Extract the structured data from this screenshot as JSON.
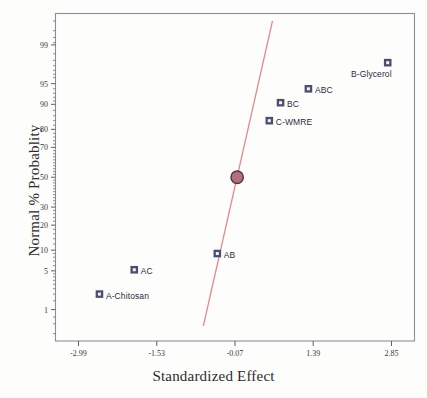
{
  "chart_data": {
    "type": "scatter",
    "title": "",
    "xlabel": "Standardized Effect",
    "ylabel": "Normal % Probablity",
    "xlim": [
      -3.42,
      3.28
    ],
    "ylim_percent": [
      0.2,
      99.8
    ],
    "grid": false,
    "legend": false,
    "xticks": [
      "-2.99",
      "-1.53",
      "-0.07",
      "1.39",
      "2.85"
    ],
    "xtick_values": [
      -2.99,
      -1.53,
      -0.07,
      1.39,
      2.85
    ],
    "yticks": [
      "99",
      "95",
      "90",
      "80",
      "70",
      "50",
      "30",
      "20",
      "10",
      "5",
      "1"
    ],
    "ytick_values": [
      99,
      95,
      90,
      80,
      70,
      50,
      30,
      20,
      10,
      5,
      1
    ],
    "series": [
      {
        "name": "effects",
        "marker": "square",
        "marker_color": "#4a4f6e",
        "points": [
          {
            "label": "A-Chitosan",
            "x": -2.6,
            "y_percent": 2.0,
            "label_side": "right"
          },
          {
            "label": "AC",
            "x": -1.95,
            "y_percent": 5.2,
            "label_side": "right"
          },
          {
            "label": "AB",
            "x": -0.4,
            "y_percent": 9.0,
            "label_side": "right"
          },
          {
            "label": "C-WMRE",
            "x": 0.57,
            "y_percent": 84.0,
            "label_side": "right"
          },
          {
            "label": "BC",
            "x": 0.78,
            "y_percent": 90.5,
            "label_side": "right"
          },
          {
            "label": "ABC",
            "x": 1.3,
            "y_percent": 94.0,
            "label_side": "right"
          },
          {
            "label": "B-Glycerol",
            "x": 2.78,
            "y_percent": 97.8,
            "label_side": "left"
          }
        ]
      },
      {
        "name": "median-reference-point",
        "marker": "circle",
        "marker_color": "#b4707a",
        "points": [
          {
            "label": "",
            "x": -0.03,
            "y_percent": 50.0
          }
        ]
      }
    ],
    "reference_line": {
      "name": "normal-fit-line",
      "color": "#e8868a",
      "x_start": -0.66,
      "y_start_percent": 0.45,
      "x_end": 0.63,
      "y_end_percent": 99.7
    }
  }
}
